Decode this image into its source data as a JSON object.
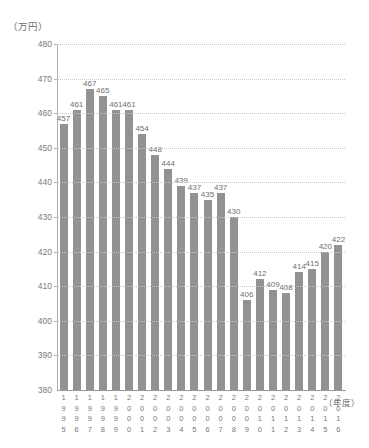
{
  "chart_data": {
    "type": "bar",
    "title": "（万円）",
    "xlabel": "（年度）",
    "ylabel": "",
    "ylim": [
      380,
      480
    ],
    "ytick_step": 10,
    "yticks": [
      380,
      390,
      400,
      410,
      420,
      430,
      440,
      450,
      460,
      470,
      480
    ],
    "grid": true,
    "legend": "none",
    "categories": [
      "1995",
      "1996",
      "1997",
      "1998",
      "1999",
      "2000",
      "2001",
      "2002",
      "2003",
      "2004",
      "2005",
      "2006",
      "2007",
      "2008",
      "2009",
      "2010",
      "2011",
      "2012",
      "2013",
      "2014",
      "2015",
      "2016"
    ],
    "values": [
      457,
      461,
      467,
      465,
      461,
      461,
      454,
      448,
      444,
      439,
      437,
      435,
      437,
      430,
      406,
      412,
      409,
      408,
      414,
      415,
      420,
      422
    ],
    "bar_color": "#929292",
    "grid_color": "#c8c8c8",
    "axis_color": "#9a9a9a",
    "text_color": "#7a7a7a"
  }
}
